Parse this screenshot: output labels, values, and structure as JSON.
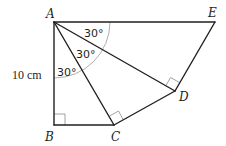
{
  "diagram": {
    "vertices": {
      "A": {
        "label": "A",
        "x": 54,
        "y": 22
      },
      "B": {
        "label": "B",
        "x": 54,
        "y": 125
      },
      "C": {
        "label": "C",
        "x": 114,
        "y": 125
      },
      "D": {
        "label": "D",
        "x": 175,
        "y": 91
      },
      "E": {
        "label": "E",
        "x": 215,
        "y": 22
      }
    },
    "angles": {
      "angle_BAC": {
        "label": "30°"
      },
      "angle_CAD": {
        "label": "30°"
      },
      "angle_DAE": {
        "label": "30°"
      }
    },
    "lengths": {
      "AB": {
        "label": "10 cm"
      }
    },
    "right_angles": [
      "B",
      "C",
      "D"
    ],
    "colors": {
      "line": "#231f20",
      "arc": "#9a9a9a",
      "right_angle_marker": "#8a8a8a"
    }
  }
}
